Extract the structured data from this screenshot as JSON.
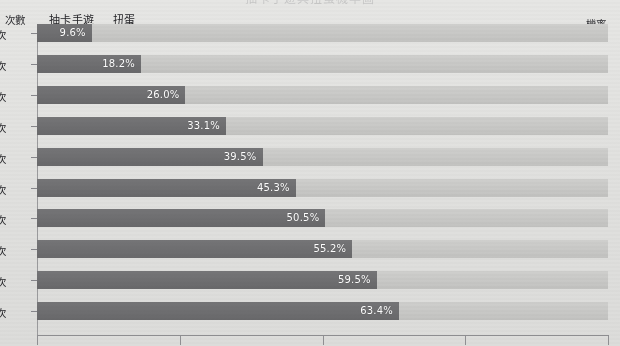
{
  "chart_data": {
    "type": "bar",
    "orientation": "horizontal",
    "stacked": true,
    "title": "",
    "xlabel": "機率",
    "ylabel": "次數",
    "categories": [
      "10次",
      "20次",
      "30次",
      "40次",
      "50次",
      "60次",
      "70次",
      "80次",
      "90次",
      "100次"
    ],
    "series": [
      {
        "name": "抽卡手遊",
        "color": "#6e6e70",
        "values": [
          9.6,
          18.2,
          26.0,
          33.1,
          39.5,
          45.3,
          50.5,
          55.2,
          59.5,
          63.4
        ],
        "labels": [
          "9.6%",
          "18.2%",
          "26.0%",
          "33.1%",
          "39.5%",
          "45.3%",
          "50.5%",
          "55.2%",
          "59.5%",
          "63.4%"
        ]
      },
      {
        "name": "扭蛋",
        "color": "#c8c8c6",
        "values": [
          90.4,
          81.8,
          74.0,
          66.9,
          60.5,
          54.7,
          49.5,
          44.8,
          40.5,
          36.6
        ],
        "labels": [
          "",
          "",
          "",
          "",
          "",
          "",
          "",
          "",
          "",
          ""
        ]
      }
    ],
    "xlim": [
      0,
      100
    ],
    "xticks": [
      0,
      25,
      50,
      75,
      100
    ],
    "xtick_labels": [
      "",
      "",
      "",
      "",
      ""
    ],
    "grid": false,
    "legend_position": "top-left"
  },
  "header": {
    "count_axis_label": "次數",
    "probability_axis_label": "機率",
    "cropped_title": "抽卡手遊與扭蛋機率圖"
  },
  "legend": {
    "items": [
      {
        "label": "抽卡手遊"
      },
      {
        "label": "扭蛋"
      }
    ]
  },
  "colors": {
    "bar_primary": "#6e6e70",
    "bar_secondary": "#c8c8c6",
    "background": "#e1e1df",
    "axis": "#8f8f92",
    "value_text": "#ffffff"
  }
}
